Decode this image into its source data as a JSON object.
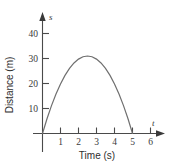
{
  "chart_data": {
    "type": "line",
    "title": "",
    "xlabel": "Time (s)",
    "ylabel": "Distance (m)",
    "x_axis_symbol": "t",
    "y_axis_symbol": "s",
    "xlim": [
      0,
      6.6
    ],
    "ylim": [
      0,
      45
    ],
    "xticks": [
      1,
      2,
      3,
      4,
      5,
      6
    ],
    "xtick_labels": [
      "1",
      "2",
      "3",
      "4",
      "5",
      "6"
    ],
    "yticks": [
      10,
      20,
      30,
      40
    ],
    "ytick_labels": [
      "10",
      "20",
      "30",
      "40"
    ],
    "grid": false,
    "legend": null,
    "curve_color": "#6f6f6f",
    "axis_color": "#4a4a4a",
    "series": [
      {
        "name": "Distance vs time",
        "shape": "parabola",
        "x_start": 0,
        "x_end": 5,
        "vertex_x": 2.5,
        "vertex_y": 31,
        "x": [
          0,
          0.25,
          0.5,
          0.75,
          1,
          1.25,
          1.5,
          1.75,
          2,
          2.25,
          2.5,
          2.75,
          3,
          3.25,
          3.5,
          3.75,
          4,
          4.25,
          4.5,
          4.75,
          5
        ],
        "values": [
          0,
          5.89,
          11.16,
          15.81,
          19.84,
          23.25,
          26.04,
          28.21,
          29.76,
          30.69,
          31,
          30.69,
          29.76,
          28.21,
          26.04,
          23.25,
          19.84,
          15.81,
          11.16,
          5.89,
          0
        ]
      }
    ]
  }
}
